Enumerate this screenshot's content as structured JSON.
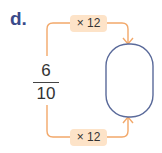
{
  "question_label": "d.",
  "fraction": {
    "numerator": "6",
    "denominator": "10"
  },
  "operations": {
    "top": "× 12",
    "bottom": "× 12"
  },
  "answer_box": {
    "value": ""
  },
  "colors": {
    "label": "#3a4a8a",
    "arrow": "#f2a86a",
    "badge_bg": "#fde3c8",
    "answer_border": "#5a6a9a"
  }
}
